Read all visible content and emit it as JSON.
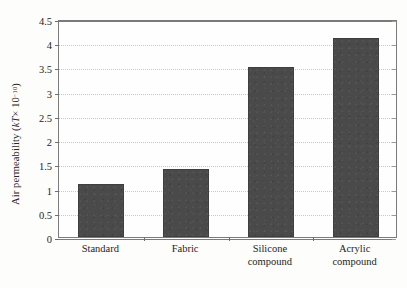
{
  "chart_data": {
    "type": "bar",
    "title": "",
    "xlabel": "",
    "ylabel": "Air permeability (kT × 10⁻¹⁰)",
    "ylabel_parts": {
      "prefix": "Air permeability (",
      "italic": "kT",
      "mid": " × 10",
      "exponent": "−10",
      "suffix": ")"
    },
    "categories": [
      "Standard",
      "Fabric",
      "Silicone compound",
      "Acrylic compound"
    ],
    "category_lines": [
      [
        "Standard"
      ],
      [
        "Fabric"
      ],
      [
        "Silicone",
        "compound"
      ],
      [
        "Acrylic",
        "compound"
      ]
    ],
    "values": [
      1.1,
      1.4,
      3.5,
      4.1
    ],
    "ylim": [
      0,
      4.5
    ],
    "ytick_labels": [
      "0",
      "0.5",
      "1",
      "1.5",
      "2",
      "2.5",
      "3",
      "3.5",
      "4",
      "4.5"
    ],
    "ytick_values": [
      0,
      0.5,
      1,
      1.5,
      2,
      2.5,
      3,
      3.5,
      4,
      4.5
    ],
    "grid": true,
    "grid_style": "dotted",
    "legend": null,
    "legend_position": "none",
    "colors": {
      "bar": "#4a4a4a",
      "grid": "#c9c9c9",
      "axis": "#7b7b7b",
      "text": "#231f20",
      "background": "#fdfdfc"
    }
  }
}
